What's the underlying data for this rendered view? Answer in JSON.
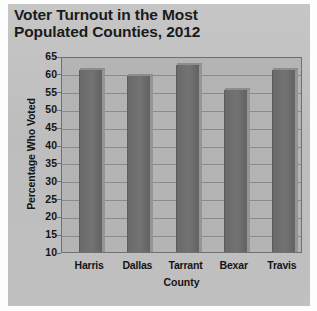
{
  "chart_data": {
    "type": "bar",
    "title": "Voter Turnout in the Most Populated Counties, 2012",
    "title_line1": "Voter Turnout in the Most",
    "title_line2": "Populated Counties, 2012",
    "xlabel": "County",
    "ylabel": "Percentage Who Voted",
    "categories": [
      "Harris",
      "Dallas",
      "Tarrant",
      "Bexar",
      "Travis"
    ],
    "values": [
      61,
      59.5,
      62.5,
      55.5,
      61
    ],
    "ylim": [
      10,
      65
    ],
    "ytick_step": 5,
    "yticks": [
      65,
      60,
      55,
      50,
      45,
      40,
      35,
      30,
      25,
      20,
      15,
      10
    ],
    "grid": true,
    "legend": "none",
    "bar_color": "#6d6d6d",
    "plot_background": "#b4b4b4",
    "panel_background": "#c3c3c3",
    "gridline_color": "#8a8a8a",
    "text_color": "#141414"
  }
}
